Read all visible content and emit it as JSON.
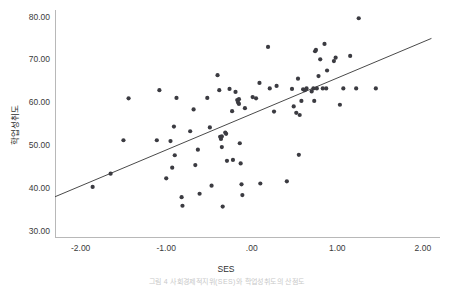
{
  "figure": {
    "background_color": "#ffffff",
    "width": 453,
    "height": 284,
    "point_color": "#3b3b41",
    "line_color": "#4a4a4a",
    "axis_color": "#b8b8b8",
    "caption": "그림 4  사회경제적지위(SES)와 학업성취도의 산점도"
  },
  "chart_data": {
    "type": "scatter",
    "title": "",
    "xlabel": "SES",
    "ylabel": "학업성취도",
    "xlim": [
      -2.3,
      2.2
    ],
    "ylim": [
      28.5,
      82.0
    ],
    "grid": false,
    "legend": null,
    "xticks": [
      -2,
      -1,
      0,
      1,
      2
    ],
    "xticklabels": [
      "-2.00",
      "-1.00",
      ".00",
      "1.00",
      "2.00"
    ],
    "yticks": [
      30,
      40,
      50,
      60,
      70,
      80
    ],
    "yticklabels": [
      "30.00",
      "40.00",
      "50.00",
      "60.00",
      "70.00",
      "80.00"
    ],
    "annotations": [],
    "fit_line": {
      "type": "linear-regression",
      "x_start": -2.3,
      "y_start": 37.9,
      "x_end": 2.1,
      "y_end": 74.9
    },
    "points": [
      {
        "x": -1.86,
        "y": 40.2
      },
      {
        "x": -1.65,
        "y": 43.3
      },
      {
        "x": -1.5,
        "y": 51.1
      },
      {
        "x": -1.44,
        "y": 60.9
      },
      {
        "x": -1.11,
        "y": 51.1
      },
      {
        "x": -1.08,
        "y": 62.8
      },
      {
        "x": -1.0,
        "y": 42.2
      },
      {
        "x": -0.95,
        "y": 50.9
      },
      {
        "x": -0.93,
        "y": 44.7
      },
      {
        "x": -0.91,
        "y": 54.3
      },
      {
        "x": -0.9,
        "y": 47.6
      },
      {
        "x": -0.88,
        "y": 61.0
      },
      {
        "x": -0.82,
        "y": 37.8
      },
      {
        "x": -0.81,
        "y": 35.8
      },
      {
        "x": -0.72,
        "y": 53.2
      },
      {
        "x": -0.68,
        "y": 58.3
      },
      {
        "x": -0.66,
        "y": 45.3
      },
      {
        "x": -0.63,
        "y": 48.9
      },
      {
        "x": -0.61,
        "y": 38.6
      },
      {
        "x": -0.52,
        "y": 61.0
      },
      {
        "x": -0.49,
        "y": 54.1
      },
      {
        "x": -0.47,
        "y": 40.5
      },
      {
        "x": -0.4,
        "y": 66.3
      },
      {
        "x": -0.38,
        "y": 62.8
      },
      {
        "x": -0.37,
        "y": 51.9
      },
      {
        "x": -0.36,
        "y": 51.4
      },
      {
        "x": -0.35,
        "y": 52.0
      },
      {
        "x": -0.35,
        "y": 49.5
      },
      {
        "x": -0.34,
        "y": 35.6
      },
      {
        "x": -0.31,
        "y": 52.9
      },
      {
        "x": -0.3,
        "y": 52.6
      },
      {
        "x": -0.29,
        "y": 46.3
      },
      {
        "x": -0.26,
        "y": 63.1
      },
      {
        "x": -0.23,
        "y": 57.9
      },
      {
        "x": -0.22,
        "y": 46.5
      },
      {
        "x": -0.19,
        "y": 62.4
      },
      {
        "x": -0.17,
        "y": 60.5
      },
      {
        "x": -0.16,
        "y": 59.9
      },
      {
        "x": -0.15,
        "y": 60.7
      },
      {
        "x": -0.15,
        "y": 59.6
      },
      {
        "x": -0.14,
        "y": 50.4
      },
      {
        "x": -0.13,
        "y": 45.7
      },
      {
        "x": -0.12,
        "y": 40.8
      },
      {
        "x": -0.11,
        "y": 38.3
      },
      {
        "x": -0.08,
        "y": 58.6
      },
      {
        "x": 0.01,
        "y": 61.2
      },
      {
        "x": 0.05,
        "y": 60.9
      },
      {
        "x": 0.09,
        "y": 64.5
      },
      {
        "x": 0.1,
        "y": 41.0
      },
      {
        "x": 0.19,
        "y": 72.9
      },
      {
        "x": 0.21,
        "y": 63.2
      },
      {
        "x": 0.26,
        "y": 57.8
      },
      {
        "x": 0.29,
        "y": 63.8
      },
      {
        "x": 0.41,
        "y": 41.5
      },
      {
        "x": 0.47,
        "y": 63.1
      },
      {
        "x": 0.49,
        "y": 59.0
      },
      {
        "x": 0.52,
        "y": 57.5
      },
      {
        "x": 0.54,
        "y": 65.5
      },
      {
        "x": 0.55,
        "y": 47.7
      },
      {
        "x": 0.56,
        "y": 57.0
      },
      {
        "x": 0.58,
        "y": 60.3
      },
      {
        "x": 0.6,
        "y": 63.0
      },
      {
        "x": 0.62,
        "y": 62.8
      },
      {
        "x": 0.64,
        "y": 63.2
      },
      {
        "x": 0.7,
        "y": 62.5
      },
      {
        "x": 0.72,
        "y": 63.2
      },
      {
        "x": 0.73,
        "y": 60.3
      },
      {
        "x": 0.74,
        "y": 71.9
      },
      {
        "x": 0.75,
        "y": 72.2
      },
      {
        "x": 0.76,
        "y": 63.2
      },
      {
        "x": 0.78,
        "y": 66.1
      },
      {
        "x": 0.8,
        "y": 70.0
      },
      {
        "x": 0.83,
        "y": 63.2
      },
      {
        "x": 0.85,
        "y": 73.6
      },
      {
        "x": 0.87,
        "y": 63.2
      },
      {
        "x": 0.88,
        "y": 67.4
      },
      {
        "x": 0.96,
        "y": 69.6
      },
      {
        "x": 0.98,
        "y": 70.4
      },
      {
        "x": 1.03,
        "y": 59.4
      },
      {
        "x": 1.07,
        "y": 63.2
      },
      {
        "x": 1.15,
        "y": 70.8
      },
      {
        "x": 1.22,
        "y": 63.2
      },
      {
        "x": 1.25,
        "y": 79.6
      },
      {
        "x": 1.45,
        "y": 63.2
      }
    ]
  }
}
